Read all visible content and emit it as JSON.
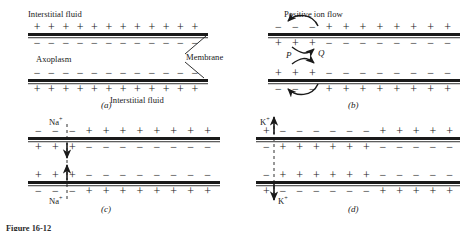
{
  "figure": {
    "caption": "Figure 16-12"
  },
  "labels": {
    "interstitial_fluid": "Interstitial fluid",
    "axoplasm": "Axoplasm",
    "membrane": "Membrane",
    "positive_ion_flow": "Positive ion flow",
    "point_p": "P",
    "point_q": "Q",
    "sodium_ion": "Na",
    "potassium_ion": "K",
    "charge_superscript": "+",
    "plus": "+",
    "minus": "−"
  },
  "panels": [
    {
      "id": "a",
      "letter": "(a)",
      "name": "resting-membrane-panel",
      "rows": [
        {
          "name": "outer-top-charges",
          "signs": [
            "+",
            "+",
            "+",
            "+",
            "+",
            "+",
            "+",
            "+",
            "+",
            "+",
            "+",
            "+"
          ]
        },
        {
          "name": "inner-top-charges",
          "signs": [
            "−",
            "−",
            "−",
            "−",
            "−",
            "−",
            "−",
            "−",
            "−",
            "−",
            "−",
            "−"
          ]
        },
        {
          "name": "inner-bottom-charges",
          "signs": [
            "−",
            "−",
            "−",
            "−",
            "−",
            "−",
            "−",
            "−",
            "−",
            "−",
            "−",
            "−"
          ]
        },
        {
          "name": "outer-bottom-charges",
          "signs": [
            "+",
            "+",
            "+",
            "+",
            "+",
            "+",
            "+",
            "+",
            "+",
            "+",
            "+",
            "+"
          ]
        }
      ]
    },
    {
      "id": "b",
      "letter": "(b)",
      "name": "depolarization-ion-flow-panel",
      "rows": [
        {
          "name": "outer-top-charges",
          "signs": [
            "−",
            "−",
            "−",
            "+",
            "+",
            "+",
            "+",
            "+",
            "+",
            "+",
            "+"
          ]
        },
        {
          "name": "inner-top-charges",
          "signs": [
            "+",
            "+",
            "+",
            "−",
            "−",
            "−",
            "−",
            "−",
            "−",
            "−",
            "−"
          ]
        },
        {
          "name": "inner-bottom-charges",
          "signs": [
            "+",
            "+",
            "+",
            "−",
            "−",
            "−",
            "−",
            "−",
            "−",
            "−",
            "−"
          ]
        },
        {
          "name": "outer-bottom-charges",
          "signs": [
            "−",
            "−",
            "−",
            "+",
            "+",
            "+",
            "+",
            "+",
            "+",
            "+",
            "+"
          ]
        }
      ]
    },
    {
      "id": "c",
      "letter": "(c)",
      "name": "sodium-influx-panel",
      "rows": [
        {
          "name": "outer-top-charges",
          "signs": [
            "−",
            "−",
            "−",
            "+",
            "+",
            "+",
            "+",
            "+",
            "+",
            "+",
            "+"
          ]
        },
        {
          "name": "inner-top-charges",
          "signs": [
            "+",
            "+",
            "+",
            "−",
            "−",
            "−",
            "−",
            "−",
            "−",
            "−",
            "−"
          ]
        },
        {
          "name": "inner-bottom-charges",
          "signs": [
            "+",
            "+",
            "+",
            "−",
            "−",
            "−",
            "−",
            "−",
            "−",
            "−",
            "−"
          ]
        },
        {
          "name": "outer-bottom-charges",
          "signs": [
            "−",
            "−",
            "−",
            "+",
            "+",
            "+",
            "+",
            "+",
            "+",
            "+",
            "+"
          ]
        }
      ]
    },
    {
      "id": "d",
      "letter": "(d)",
      "name": "potassium-efflux-panel",
      "rows": [
        {
          "name": "outer-top-charges",
          "signs": [
            "+",
            "−",
            "−",
            "−",
            "−",
            "−",
            "−",
            "+",
            "+",
            "+",
            "+",
            "+"
          ]
        },
        {
          "name": "inner-top-charges",
          "signs": [
            "−",
            "+",
            "+",
            "+",
            "+",
            "+",
            "+",
            "−",
            "−",
            "−",
            "−",
            "−"
          ]
        },
        {
          "name": "inner-bottom-charges",
          "signs": [
            "−",
            "+",
            "+",
            "+",
            "+",
            "+",
            "+",
            "−",
            "−",
            "−",
            "−",
            "−"
          ]
        },
        {
          "name": "outer-bottom-charges",
          "signs": [
            "+",
            "−",
            "−",
            "−",
            "−",
            "−",
            "−",
            "+",
            "+",
            "+",
            "+",
            "+"
          ]
        }
      ]
    }
  ]
}
